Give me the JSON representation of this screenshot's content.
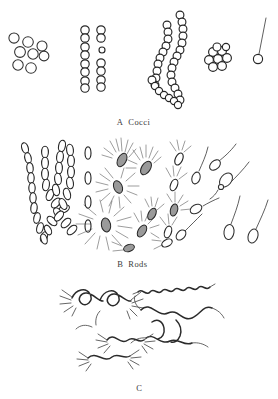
{
  "figure": {
    "background_color": "#ffffff",
    "ink_color": "#2b2b2b",
    "width": 278,
    "height": 399
  },
  "panels": [
    {
      "id": "A",
      "letter": "A",
      "name": "Cocci",
      "label_text": "A  Cocci",
      "groups": [
        {
          "name": "micrococci-scattered",
          "cell_count": 8,
          "arrangement": "irregular scattered single cells"
        },
        {
          "name": "diplococci-pairs",
          "cell_count": 15,
          "arrangement": "pairs in four rows, two columns"
        },
        {
          "name": "streptococci-chains",
          "cell_count": 52,
          "arrangement": "two long sinuous chains"
        },
        {
          "name": "staphylococci-cluster",
          "cell_count": 9,
          "arrangement": "tight grape-like cluster"
        },
        {
          "name": "stalked-coccus",
          "cell_count": 1,
          "arrangement": "single coccus with long stalk"
        }
      ]
    },
    {
      "id": "B",
      "letter": "B",
      "name": "Rods",
      "label_text": "B  Rods",
      "groups": [
        {
          "name": "streptobacilli-chains",
          "cell_count": 38,
          "arrangement": "branching chains of rods"
        },
        {
          "name": "single-rods-column",
          "cell_count": 4,
          "arrangement": "vertical column of single rods"
        },
        {
          "name": "peritrichous-rods",
          "cell_count": 6,
          "arrangement": "rods with flagella all around"
        },
        {
          "name": "lophotrichous-rods",
          "cell_count": 6,
          "arrangement": "rods with polar tuft of flagella"
        },
        {
          "name": "monotrichous-rods",
          "cell_count": 8,
          "arrangement": "rods with single polar flagellum"
        }
      ]
    },
    {
      "id": "C",
      "letter": "C",
      "name": "",
      "label_text": "C",
      "groups": [
        {
          "name": "spirochete-coiled",
          "cell_count": 2,
          "arrangement": "tightly coiled spirochetes with flagellar tufts"
        },
        {
          "name": "spirillum-rigid",
          "cell_count": 1,
          "arrangement": "rigid helical spirillum"
        },
        {
          "name": "spirillum-wavy",
          "cell_count": 2,
          "arrangement": "wavy spirilla with terminal flagella"
        },
        {
          "name": "vibrio-comma",
          "cell_count": 2,
          "arrangement": "comma-shaped vibrios"
        },
        {
          "name": "spirillum-tufted",
          "cell_count": 2,
          "arrangement": "spirilla with tufts at both poles"
        }
      ]
    }
  ]
}
